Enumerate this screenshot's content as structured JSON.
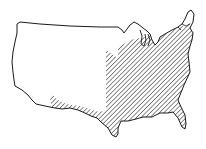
{
  "map": {
    "subject": "Contiguous United States outline",
    "style": "black-and-white line drawing",
    "shaded_region": {
      "description": "Diagonal hatching covering the eastern United States and a strip along the southern border (Texas / southern plains)",
      "pattern": "diagonal-hatch"
    },
    "colors": {
      "outline": "#1a1a1a",
      "hatch": "#2a2a2a",
      "background": "#ffffff"
    }
  }
}
